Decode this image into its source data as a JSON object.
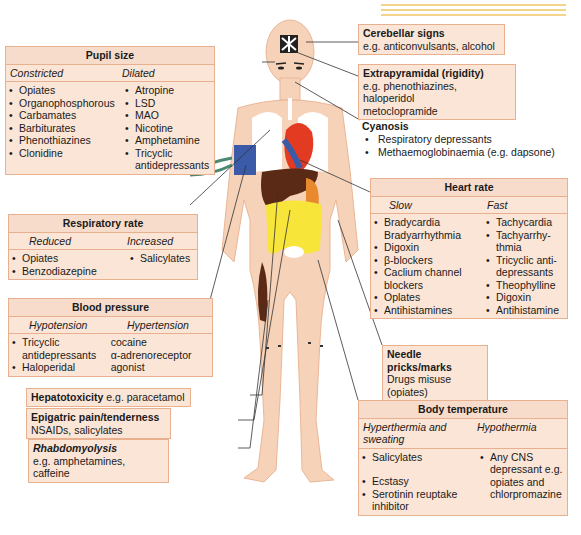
{
  "pupil_size": {
    "title": "Pupil size",
    "constricted": {
      "label": "Constricted",
      "items": [
        "Opiates",
        "Organophosphorous",
        "Carbamates",
        "Barbiturates",
        "Phenothiazines",
        "Clonidine"
      ]
    },
    "dilated": {
      "label": "Dilated",
      "items": [
        "Atropine",
        "LSD",
        "MAO",
        "Nicotine",
        "Amphetamine",
        "Tricyclic antidepressants"
      ]
    }
  },
  "respiratory_rate": {
    "title": "Respiratory rate",
    "reduced": {
      "label": "Reduced",
      "items": [
        "Opiates",
        "Benzodiazepine"
      ]
    },
    "increased": {
      "label": "Increased",
      "items": [
        "Salicylates"
      ]
    }
  },
  "blood_pressure": {
    "title": "Blood pressure",
    "hypotension": {
      "label": "Hypotension",
      "items": [
        "Tricyclic antidepressants",
        "Haloperidal"
      ]
    },
    "hypertension": {
      "label": "Hypertension",
      "items": [
        "cocaine",
        "α-adrenoreceptor agonist"
      ]
    }
  },
  "hepatotoxicity": {
    "title": "Hepatotoxicity",
    "text": "e.g. paracetamol"
  },
  "epigastric": {
    "title": "Epigatric pain/tenderness",
    "text": "NSAIDs, salicylates"
  },
  "rhabdomyolysis": {
    "title": "Rhabdomyolysis",
    "text": "e.g. amphetamines, caffeine"
  },
  "cerebellar": {
    "title": "Cerebellar signs",
    "text": "e.g. anticonvulsants, alcohol"
  },
  "extrapyramidal": {
    "title": "Extrapyramidal (rigidity)",
    "text1": "e.g. phenothiazines, haloperidol",
    "text2": "metoclopramide"
  },
  "cyanosis": {
    "title": "Cyanosis",
    "items": [
      "Respiratory depressants",
      "Methaemoglobinaemia (e.g. dapsone)"
    ]
  },
  "heart_rate": {
    "title": "Heart rate",
    "slow": {
      "label": "Slow",
      "items": [
        "Bradycardia Bradyarrhythmia",
        "Digoxin",
        "β-blockers",
        "Caclium channel blockers",
        "Oplates",
        "Antihistamines"
      ]
    },
    "fast": {
      "label": "Fast",
      "items": [
        "Tachycardia",
        "Tachyarrhy-thmia",
        "Tricyclic anti-depressants",
        "Theophylline",
        "Digoxin",
        "Antihistamine"
      ]
    }
  },
  "needle": {
    "title": "Needle pricks/marks",
    "text": "Drugs misuse (opiates)"
  },
  "body_temperature": {
    "title": "Body temperature",
    "hyper": {
      "label": "Hyperthermia and sweating",
      "items": [
        "Salicylates",
        "Ecstasy",
        "Serotinin reuptake inhibitor"
      ]
    },
    "hypo": {
      "label": "Hypothermia",
      "items": [
        "Any CNS depressant e.g. opiates and chlorpromazine"
      ]
    }
  },
  "colors": {
    "box_fill": "#fbe5d6",
    "box_border": "#e8b08e",
    "skin": "#f6d2b8",
    "heart": "#e33a22",
    "liver": "#5a2a16",
    "intestine": "#f7e53a",
    "cuff": "#3b5ba8",
    "stripe": "#f2d58a"
  }
}
